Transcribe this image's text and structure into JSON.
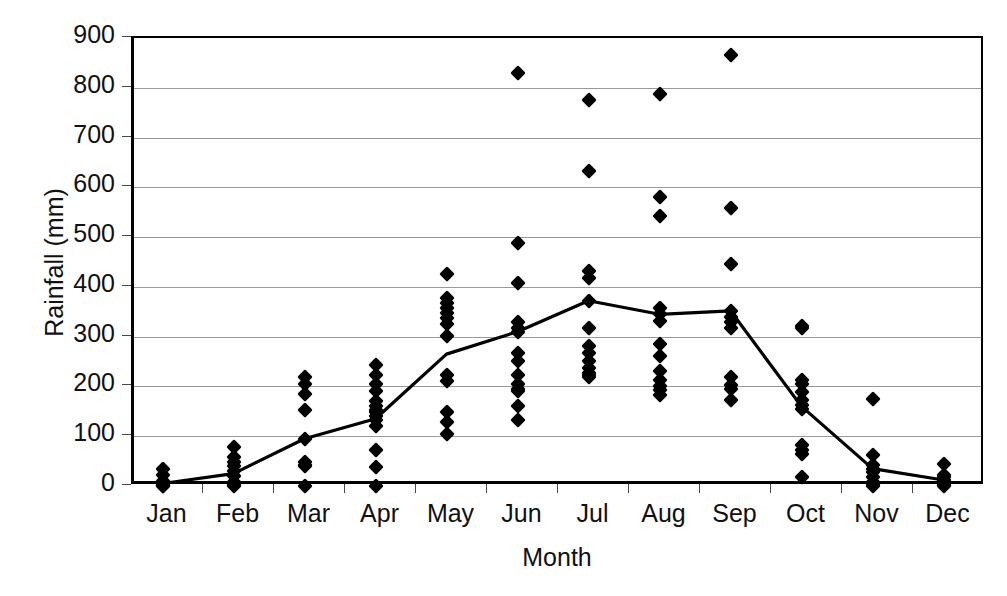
{
  "chart_data": {
    "type": "scatter",
    "title": "",
    "xlabel": "Month",
    "ylabel": "Rainfall (mm)",
    "categories": [
      "Jan",
      "Feb",
      "Mar",
      "Apr",
      "May",
      "Jun",
      "Jul",
      "Aug",
      "Sep",
      "Oct",
      "Nov",
      "Dec"
    ],
    "ylim": [
      0,
      900
    ],
    "yticks": [
      0,
      100,
      200,
      300,
      400,
      500,
      600,
      700,
      800,
      900
    ],
    "ytick_labels": [
      "0",
      "100",
      "200",
      "300",
      "400",
      "500",
      "600",
      "700",
      "800",
      "900"
    ],
    "grid": true,
    "legend": null,
    "marker": "filled-diamond",
    "marker_color": "#000000",
    "line_color": "#000000",
    "scatter_series": {
      "name": "Annual rainfall observations",
      "points_by_month": {
        "Jan": [
          35,
          22,
          10,
          5,
          2,
          0,
          0
        ],
        "Feb": [
          78,
          58,
          48,
          40,
          30,
          20,
          8,
          2,
          0
        ],
        "Mar": [
          218,
          205,
          185,
          152,
          95,
          48,
          42,
          40,
          0
        ],
        "Apr": [
          243,
          222,
          205,
          190,
          170,
          160,
          152,
          148,
          140,
          132,
          120,
          72,
          38,
          0
        ],
        "May": [
          425,
          378,
          368,
          358,
          348,
          338,
          325,
          302,
          222,
          210,
          148,
          128,
          105
        ],
        "Jun": [
          830,
          488,
          408,
          330,
          318,
          310,
          268,
          252,
          222,
          205,
          195,
          190,
          160,
          132
        ],
        "Jul": [
          775,
          633,
          432,
          418,
          372,
          318,
          282,
          268,
          252,
          238,
          228,
          222,
          218
        ],
        "Aug": [
          788,
          580,
          543,
          358,
          345,
          332,
          285,
          262,
          232,
          212,
          200,
          192,
          182
        ],
        "Sep": [
          865,
          558,
          445,
          352,
          340,
          330,
          318,
          218,
          202,
          195,
          172
        ],
        "Oct": [
          322,
          318,
          212,
          205,
          188,
          172,
          162,
          155,
          82,
          72,
          65,
          18
        ],
        "Nov": [
          175,
          62,
          42,
          35,
          28,
          18,
          8,
          2,
          0
        ],
        "Dec": [
          45,
          22,
          18,
          12,
          5,
          2,
          0
        ]
      }
    },
    "line_series": {
      "name": "Mean monthly rainfall",
      "values": [
        5,
        25,
        95,
        135,
        265,
        310,
        372,
        345,
        352,
        160,
        35,
        12
      ]
    }
  }
}
